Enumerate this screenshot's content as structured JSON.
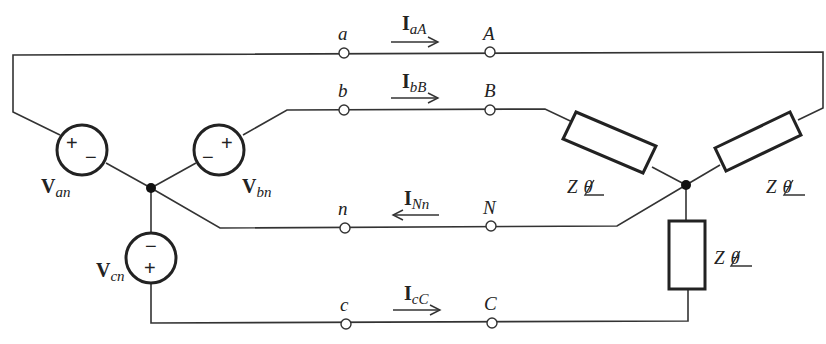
{
  "diagram": {
    "type": "three-phase Y-Y circuit with neutral",
    "source_nodes": {
      "line_terminals": [
        "a",
        "b",
        "n",
        "c"
      ]
    },
    "load_nodes": {
      "line_terminals": [
        "A",
        "B",
        "N",
        "C"
      ]
    },
    "sources": [
      {
        "id": "Van",
        "label_main": "V",
        "label_sub": "an",
        "plus": "+",
        "minus": "−"
      },
      {
        "id": "Vbn",
        "label_main": "V",
        "label_sub": "bn",
        "plus": "+",
        "minus": "−"
      },
      {
        "id": "Vcn",
        "label_main": "V",
        "label_sub": "cn",
        "plus": "+",
        "minus": "−"
      }
    ],
    "currents": [
      {
        "id": "IaA",
        "label_main": "I",
        "label_sub": "aA",
        "direction": "right"
      },
      {
        "id": "IbB",
        "label_main": "I",
        "label_sub": "bB",
        "direction": "right"
      },
      {
        "id": "INn",
        "label_main": "I",
        "label_sub": "Nn",
        "direction": "left"
      },
      {
        "id": "IcC",
        "label_main": "I",
        "label_sub": "cC",
        "direction": "right"
      }
    ],
    "loads": [
      {
        "id": "ZA",
        "z": "Z",
        "angle": "θ"
      },
      {
        "id": "ZB",
        "z": "Z",
        "angle": "θ"
      },
      {
        "id": "ZC",
        "z": "Z",
        "angle": "θ"
      }
    ],
    "colors": {
      "line": "#333333",
      "background": "#ffffff"
    }
  }
}
